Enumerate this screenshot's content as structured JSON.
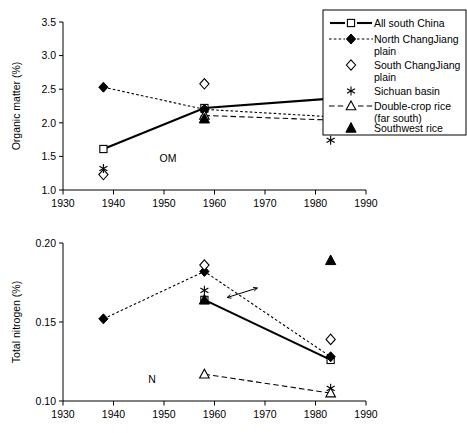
{
  "figure": {
    "annotation_top": "OM",
    "annotation_bottom": "N"
  },
  "legend": {
    "items": [
      {
        "label_line1": "All south China",
        "label_line2": "",
        "marker": "open-square",
        "line": "solid"
      },
      {
        "label_line1": "North ChangJiang",
        "label_line2": "plain",
        "marker": "filled-diamond",
        "line": "dotted"
      },
      {
        "label_line1": "South ChangJiang",
        "label_line2": "plain",
        "marker": "open-diamond",
        "line": "none"
      },
      {
        "label_line1": "Sichuan basin",
        "label_line2": "",
        "marker": "asterisk",
        "line": "none"
      },
      {
        "label_line1": "Double-crop rice",
        "label_line2": "(far south)",
        "marker": "open-triangle",
        "line": "dashed"
      },
      {
        "label_line1": "Southwest rice",
        "label_line2": "",
        "marker": "filled-triangle",
        "line": "none"
      }
    ]
  },
  "chart_data": [
    {
      "type": "scatter",
      "id": "organic-matter",
      "title": "",
      "annotation": "OM",
      "xlabel": "",
      "ylabel": "Organic matter (%)",
      "xlim": [
        1930,
        1990
      ],
      "ylim": [
        1.0,
        3.5
      ],
      "xticks": [
        1930,
        1940,
        1950,
        1960,
        1970,
        1980,
        1990
      ],
      "yticks": [
        1.0,
        1.5,
        2.0,
        2.5,
        3.0,
        3.5
      ],
      "xticklabels": [
        "1930",
        "1940",
        "1950",
        "1960",
        "1970",
        "1980",
        "1990"
      ],
      "yticklabels": [
        "1.0",
        "1.5",
        "2.0",
        "2.5",
        "3.0",
        "3.5"
      ],
      "grid": false,
      "series": [
        {
          "name": "All south China",
          "marker": "open-square",
          "line": "solid",
          "x": [
            1938,
            1958,
            1983
          ],
          "values": [
            1.61,
            2.22,
            2.36
          ]
        },
        {
          "name": "North ChangJiang plain",
          "marker": "filled-diamond",
          "line": "dotted",
          "x": [
            1938,
            1958,
            1983
          ],
          "values": [
            2.53,
            2.2,
            2.09
          ]
        },
        {
          "name": "South ChangJiang plain",
          "marker": "open-diamond",
          "line": "none",
          "x": [
            1938,
            1958,
            1983
          ],
          "values": [
            1.23,
            2.58,
            2.5
          ]
        },
        {
          "name": "Sichuan basin",
          "marker": "asterisk",
          "line": "none",
          "x": [
            1938,
            1958,
            1983
          ],
          "values": [
            1.32,
            2.13,
            1.74
          ]
        },
        {
          "name": "Double-crop rice (far south)",
          "marker": "open-triangle",
          "line": "dashed",
          "x": [
            1958,
            1983
          ],
          "values": [
            2.11,
            2.04
          ]
        },
        {
          "name": "Southwest rice",
          "marker": "filled-triangle",
          "line": "none",
          "x": [
            1958,
            1983
          ],
          "values": [
            2.06,
            3.35
          ]
        }
      ]
    },
    {
      "type": "scatter",
      "id": "total-nitrogen",
      "title": "",
      "annotation": "N",
      "xlabel": "",
      "ylabel": "Total nitrogen (%)",
      "xlim": [
        1930,
        1990
      ],
      "ylim": [
        0.1,
        0.2
      ],
      "xticks": [
        1930,
        1940,
        1950,
        1960,
        1970,
        1980,
        1990
      ],
      "yticks": [
        0.1,
        0.15,
        0.2
      ],
      "xticklabels": [
        "1930",
        "1940",
        "1950",
        "1960",
        "1970",
        "1980",
        "1990"
      ],
      "yticklabels": [
        "0.10",
        "0.15",
        "0.20"
      ],
      "grid": false,
      "annotations": [
        {
          "type": "double-arrow",
          "x1": 1962.5,
          "y1": 0.1655,
          "x2": 1968.5,
          "y2": 0.1715
        }
      ],
      "series": [
        {
          "name": "All south China",
          "marker": "open-square",
          "line": "solid",
          "x": [
            1958,
            1983
          ],
          "values": [
            0.164,
            0.126
          ]
        },
        {
          "name": "North ChangJiang plain",
          "marker": "filled-diamond",
          "line": "dotted",
          "x": [
            1938,
            1958,
            1983
          ],
          "values": [
            0.152,
            0.182,
            0.128
          ]
        },
        {
          "name": "South ChangJiang plain",
          "marker": "open-diamond",
          "line": "none",
          "x": [
            1958,
            1983
          ],
          "values": [
            0.186,
            0.139
          ]
        },
        {
          "name": "Sichuan basin",
          "marker": "asterisk",
          "line": "none",
          "x": [
            1958,
            1983
          ],
          "values": [
            0.17,
            0.108
          ]
        },
        {
          "name": "Double-crop rice (far south)",
          "marker": "open-triangle",
          "line": "dashed",
          "x": [
            1958,
            1983
          ],
          "values": [
            0.117,
            0.105
          ]
        },
        {
          "name": "Southwest rice",
          "marker": "filled-triangle",
          "line": "none",
          "x": [
            1958,
            1983
          ],
          "values": [
            0.164,
            0.189
          ]
        }
      ]
    }
  ]
}
